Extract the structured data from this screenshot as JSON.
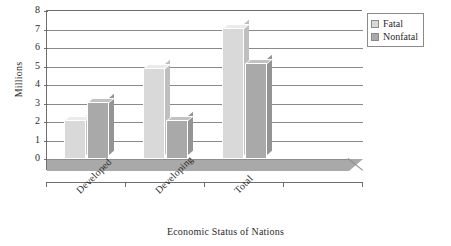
{
  "chart_data": {
    "type": "bar",
    "title": "",
    "xlabel": "Economic Status of Nations",
    "ylabel": "Millions",
    "categories": [
      "Developed",
      "Developing",
      "Total"
    ],
    "series": [
      {
        "name": "Fatal",
        "color": "#d9d9d9",
        "values": [
          2.1,
          4.9,
          7.1
        ]
      },
      {
        "name": "Nonfatal",
        "color": "#a9a9a9",
        "values": [
          3.1,
          2.1,
          5.2
        ]
      }
    ],
    "ylim": [
      0,
      8
    ],
    "yticks": [
      0,
      1,
      2,
      3,
      4,
      5,
      6,
      7,
      8
    ],
    "ytick_labels": [
      "0",
      "1",
      "2",
      "3",
      "4",
      "5",
      "6",
      "7",
      "8"
    ],
    "grid": true,
    "legend_position": "top-right",
    "style": "3d-column"
  },
  "legend": {
    "entries": [
      {
        "label": "Fatal"
      },
      {
        "label": "Nonfatal"
      }
    ]
  }
}
